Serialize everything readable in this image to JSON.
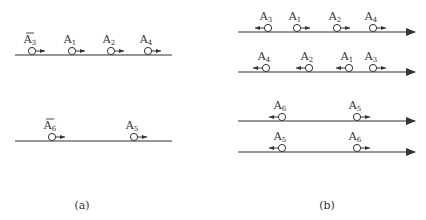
{
  "panels": [
    {
      "id": "a",
      "caption": "(a)",
      "lines": [
        {
          "y": 55,
          "x1": 15,
          "x2": 172,
          "arrowhead": false,
          "particles": [
            {
              "name": "A",
              "sub": "3",
              "bar": true,
              "x": 32,
              "dir": "right"
            },
            {
              "name": "A",
              "sub": "1",
              "bar": false,
              "x": 72,
              "dir": "right"
            },
            {
              "name": "A",
              "sub": "2",
              "bar": false,
              "x": 111,
              "dir": "right"
            },
            {
              "name": "A",
              "sub": "4",
              "bar": false,
              "x": 148,
              "dir": "right"
            }
          ]
        },
        {
          "y": 141,
          "x1": 15,
          "x2": 172,
          "arrowhead": false,
          "particles": [
            {
              "name": "A",
              "sub": "6",
              "bar": true,
              "x": 52,
              "dir": "right"
            },
            {
              "name": "A",
              "sub": "5",
              "bar": false,
              "x": 134,
              "dir": "right"
            }
          ]
        }
      ]
    },
    {
      "id": "b",
      "caption": "(b)",
      "lines": [
        {
          "y": 32,
          "x1": 238,
          "x2": 415,
          "arrowhead": true,
          "particles": [
            {
              "name": "A",
              "sub": "3",
              "bar": false,
              "x": 268,
              "dir": "left"
            },
            {
              "name": "A",
              "sub": "1",
              "bar": false,
              "x": 297,
              "dir": "right"
            },
            {
              "name": "A",
              "sub": "2",
              "bar": false,
              "x": 337,
              "dir": "right"
            },
            {
              "name": "A",
              "sub": "4",
              "bar": false,
              "x": 373,
              "dir": "right"
            }
          ]
        },
        {
          "y": 72,
          "x1": 238,
          "x2": 415,
          "arrowhead": true,
          "particles": [
            {
              "name": "A",
              "sub": "4",
              "bar": false,
              "x": 266,
              "dir": "left"
            },
            {
              "name": "A",
              "sub": "2",
              "bar": false,
              "x": 309,
              "dir": "left"
            },
            {
              "name": "A",
              "sub": "1",
              "bar": false,
              "x": 349,
              "dir": "left"
            },
            {
              "name": "A",
              "sub": "3",
              "bar": false,
              "x": 373,
              "dir": "right"
            }
          ]
        },
        {
          "y": 121,
          "x1": 238,
          "x2": 415,
          "arrowhead": true,
          "particles": [
            {
              "name": "A",
              "sub": "6",
              "bar": false,
              "x": 282,
              "dir": "left"
            },
            {
              "name": "A",
              "sub": "5",
              "bar": false,
              "x": 357,
              "dir": "right"
            }
          ]
        },
        {
          "y": 152,
          "x1": 238,
          "x2": 415,
          "arrowhead": true,
          "particles": [
            {
              "name": "A",
              "sub": "5",
              "bar": false,
              "x": 282,
              "dir": "left"
            },
            {
              "name": "A",
              "sub": "6",
              "bar": false,
              "x": 357,
              "dir": "right"
            }
          ]
        }
      ]
    }
  ],
  "captions": {
    "a": "(a)",
    "b": "(b)"
  },
  "colors": {
    "stroke": "#333333",
    "background": "#ffffff"
  }
}
